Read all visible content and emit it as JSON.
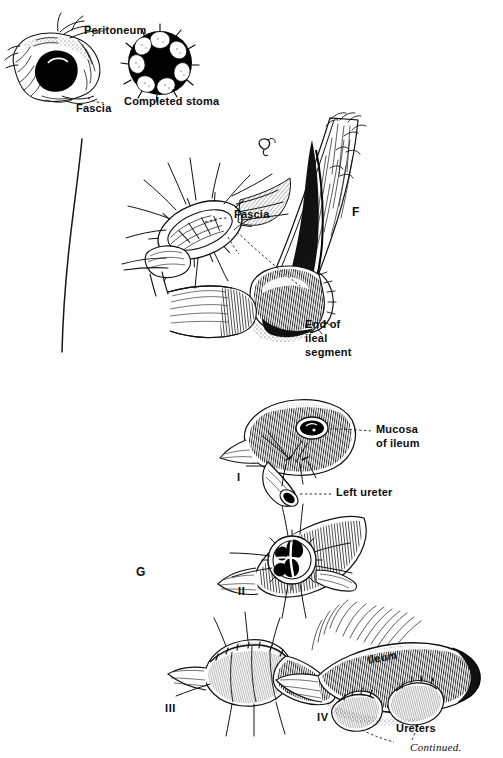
{
  "plate": {
    "width": 503,
    "height": 758,
    "background": "#ffffff",
    "ink": "#000000",
    "caption": "Continued."
  },
  "panels": {
    "top": {
      "key": "",
      "labels": {
        "peritoneum": "Peritoneum",
        "fascia": "Fascia",
        "completed_stoma": "Completed stoma"
      }
    },
    "f": {
      "key": "F",
      "labels": {
        "fascia": "Fascia",
        "end_of_ileal_segment_line1": "End of",
        "end_of_ileal_segment_line2": "ileal",
        "end_of_ileal_segment_line3": "segment"
      }
    },
    "g": {
      "key": "G",
      "steps": [
        {
          "numeral": "I",
          "labels": [
            "Mucosa",
            "of ileum",
            "Left ureter"
          ]
        },
        {
          "numeral": "II",
          "labels": []
        },
        {
          "numeral": "III",
          "labels": []
        },
        {
          "numeral": "IV",
          "labels": [
            "Ileum",
            "Ureters"
          ]
        }
      ],
      "labels": {
        "mucosa_line1": "Mucosa",
        "mucosa_line2": "of ileum",
        "left_ureter": "Left ureter",
        "ileum": "Ileum",
        "ureters": "Ureters"
      }
    }
  }
}
